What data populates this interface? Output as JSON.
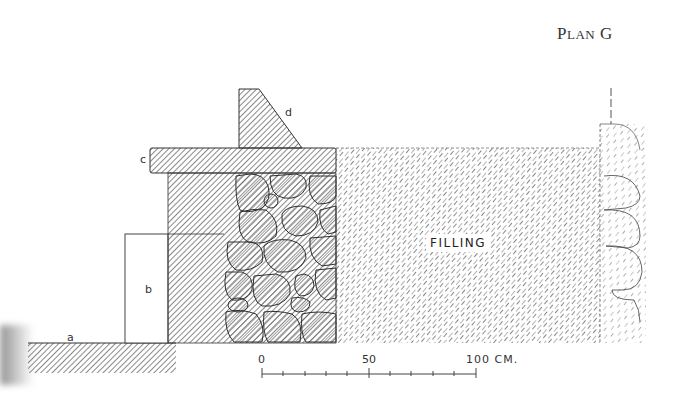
{
  "title": {
    "prefix": "P",
    "small_caps": "LAN",
    "suffix": " G"
  },
  "labels": {
    "a": "a",
    "b": "b",
    "c": "c",
    "d": "d",
    "filling": "FILLING"
  },
  "scale_bar": {
    "ticks": [
      "0",
      "50",
      "100 CM."
    ],
    "minor_divisions": 10,
    "unit": "CM."
  },
  "colors": {
    "ink": "#333333",
    "hatch_dark": "#555555",
    "hatch_light": "#8a8a8a",
    "background": "#ffffff"
  }
}
